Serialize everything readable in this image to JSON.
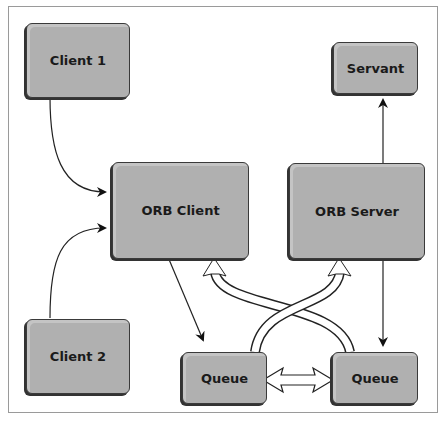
{
  "diagram": {
    "nodes": [
      {
        "id": "client1",
        "label": "Client 1"
      },
      {
        "id": "client2",
        "label": "Client 2"
      },
      {
        "id": "orb_client",
        "label": "ORB Client"
      },
      {
        "id": "orb_server",
        "label": "ORB Server"
      },
      {
        "id": "servant",
        "label": "Servant"
      },
      {
        "id": "queue_left",
        "label": "Queue"
      },
      {
        "id": "queue_right",
        "label": "Queue"
      }
    ],
    "edges": [
      {
        "from": "client1",
        "to": "orb_client",
        "style": "line-arrow"
      },
      {
        "from": "client2",
        "to": "orb_client",
        "style": "line-arrow"
      },
      {
        "from": "orb_client",
        "to": "queue_left",
        "style": "line-arrow"
      },
      {
        "from": "orb_server",
        "to": "servant",
        "style": "line-arrow"
      },
      {
        "from": "orb_server",
        "to": "queue_right",
        "style": "line-arrow"
      },
      {
        "from": "queue_left",
        "to": "orb_server",
        "style": "hollow-arrow"
      },
      {
        "from": "queue_right",
        "to": "orb_client",
        "style": "hollow-arrow"
      },
      {
        "from": "queue_left",
        "to": "queue_right",
        "style": "hollow-double-arrow"
      }
    ]
  }
}
